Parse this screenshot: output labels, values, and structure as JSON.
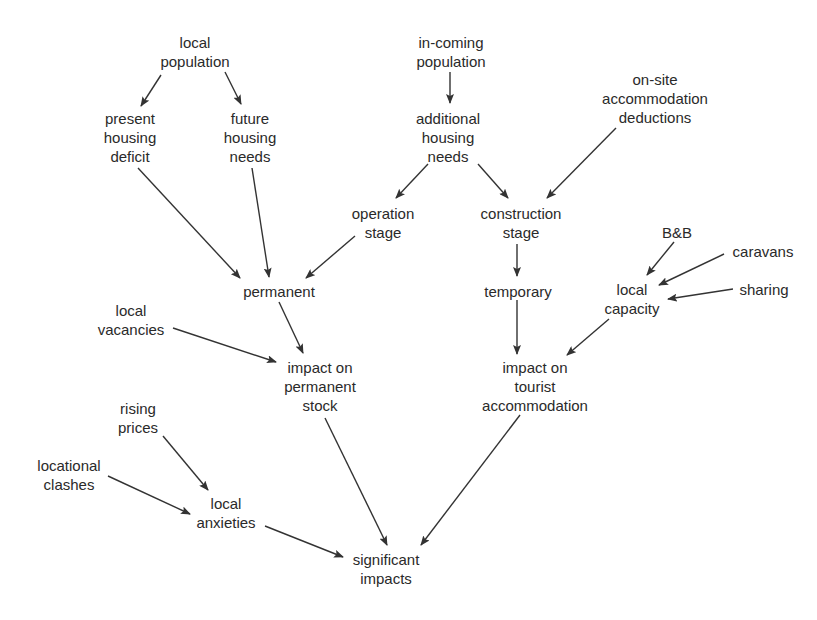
{
  "diagram": {
    "type": "flow-diagram",
    "colors": {
      "text": "#2a2a2a",
      "arrow": "#333333",
      "background": "#ffffff"
    },
    "nodes": [
      {
        "id": "local-population",
        "lines": [
          "local",
          "population"
        ],
        "x": 195,
        "y": 33
      },
      {
        "id": "present-housing-deficit",
        "lines": [
          "present",
          "housing",
          "deficit"
        ],
        "x": 130,
        "y": 109
      },
      {
        "id": "future-housing-needs",
        "lines": [
          "future",
          "housing",
          "needs"
        ],
        "x": 250,
        "y": 109
      },
      {
        "id": "in-coming-population",
        "lines": [
          "in-coming",
          "population"
        ],
        "x": 451,
        "y": 33
      },
      {
        "id": "additional-housing-needs",
        "lines": [
          "additional",
          "housing",
          "needs"
        ],
        "x": 448,
        "y": 109
      },
      {
        "id": "on-site-accommodation-deductions",
        "lines": [
          "on-site",
          "accommodation",
          "deductions"
        ],
        "x": 655,
        "y": 70
      },
      {
        "id": "operation-stage",
        "lines": [
          "operation",
          "stage"
        ],
        "x": 383,
        "y": 204
      },
      {
        "id": "construction-stage",
        "lines": [
          "construction",
          "stage"
        ],
        "x": 521,
        "y": 204
      },
      {
        "id": "bnb",
        "lines": [
          "B&B"
        ],
        "x": 677,
        "y": 223
      },
      {
        "id": "caravans",
        "lines": [
          "caravans"
        ],
        "x": 763,
        "y": 242
      },
      {
        "id": "sharing",
        "lines": [
          "sharing"
        ],
        "x": 764,
        "y": 280
      },
      {
        "id": "local-capacity",
        "lines": [
          "local",
          "capacity"
        ],
        "x": 632,
        "y": 280
      },
      {
        "id": "permanent",
        "lines": [
          "permanent"
        ],
        "x": 279,
        "y": 282
      },
      {
        "id": "temporary",
        "lines": [
          "temporary"
        ],
        "x": 518,
        "y": 282
      },
      {
        "id": "local-vacancies",
        "lines": [
          "local",
          "vacancies"
        ],
        "x": 131,
        "y": 301
      },
      {
        "id": "impact-on-permanent-stock",
        "lines": [
          "impact on",
          "permanent",
          "stock"
        ],
        "x": 320,
        "y": 358
      },
      {
        "id": "impact-on-tourist-accommodation",
        "lines": [
          "impact on",
          "tourist",
          "accommodation"
        ],
        "x": 535,
        "y": 358
      },
      {
        "id": "rising-prices",
        "lines": [
          "rising",
          "prices"
        ],
        "x": 138,
        "y": 399
      },
      {
        "id": "locational-clashes",
        "lines": [
          "locational",
          "clashes"
        ],
        "x": 69,
        "y": 456
      },
      {
        "id": "local-anxieties",
        "lines": [
          "local",
          "anxieties"
        ],
        "x": 226,
        "y": 494
      },
      {
        "id": "significant-impacts",
        "lines": [
          "significant",
          "impacts"
        ],
        "x": 386,
        "y": 550
      }
    ],
    "edges": [
      {
        "from": "local-population",
        "to": "present-housing-deficit",
        "x1": 161,
        "y1": 75,
        "x2": 141,
        "y2": 106
      },
      {
        "from": "local-population",
        "to": "future-housing-needs",
        "x1": 225,
        "y1": 72,
        "x2": 241,
        "y2": 104
      },
      {
        "from": "in-coming-population",
        "to": "additional-housing-needs",
        "x1": 450,
        "y1": 72,
        "x2": 450,
        "y2": 103
      },
      {
        "from": "present-housing-deficit",
        "to": "permanent",
        "x1": 138,
        "y1": 168,
        "x2": 240,
        "y2": 278
      },
      {
        "from": "future-housing-needs",
        "to": "permanent",
        "x1": 252,
        "y1": 168,
        "x2": 269,
        "y2": 277
      },
      {
        "from": "additional-housing-needs",
        "to": "operation-stage",
        "x1": 428,
        "y1": 164,
        "x2": 396,
        "y2": 198
      },
      {
        "from": "additional-housing-needs",
        "to": "construction-stage",
        "x1": 478,
        "y1": 164,
        "x2": 508,
        "y2": 198
      },
      {
        "from": "on-site-accommodation-deductions",
        "to": "construction-stage",
        "x1": 616,
        "y1": 128,
        "x2": 547,
        "y2": 198
      },
      {
        "from": "operation-stage",
        "to": "permanent",
        "x1": 355,
        "y1": 236,
        "x2": 306,
        "y2": 278
      },
      {
        "from": "construction-stage",
        "to": "temporary",
        "x1": 517,
        "y1": 244,
        "x2": 517,
        "y2": 276
      },
      {
        "from": "bnb",
        "to": "local-capacity",
        "x1": 674,
        "y1": 242,
        "x2": 647,
        "y2": 275
      },
      {
        "from": "caravans",
        "to": "local-capacity",
        "x1": 724,
        "y1": 254,
        "x2": 659,
        "y2": 285
      },
      {
        "from": "sharing",
        "to": "local-capacity",
        "x1": 733,
        "y1": 289,
        "x2": 668,
        "y2": 299
      },
      {
        "from": "permanent",
        "to": "impact-on-permanent-stock",
        "x1": 279,
        "y1": 302,
        "x2": 303,
        "y2": 353
      },
      {
        "from": "local-vacancies",
        "to": "impact-on-permanent-stock",
        "x1": 173,
        "y1": 328,
        "x2": 276,
        "y2": 362
      },
      {
        "from": "temporary",
        "to": "impact-on-tourist-accommodation",
        "x1": 517,
        "y1": 300,
        "x2": 517,
        "y2": 354
      },
      {
        "from": "local-capacity",
        "to": "impact-on-tourist-accommodation",
        "x1": 609,
        "y1": 319,
        "x2": 567,
        "y2": 355
      },
      {
        "from": "impact-on-permanent-stock",
        "to": "significant-impacts",
        "x1": 325,
        "y1": 418,
        "x2": 387,
        "y2": 545
      },
      {
        "from": "impact-on-tourist-accommodation",
        "to": "significant-impacts",
        "x1": 520,
        "y1": 415,
        "x2": 421,
        "y2": 545
      },
      {
        "from": "rising-prices",
        "to": "local-anxieties",
        "x1": 163,
        "y1": 436,
        "x2": 208,
        "y2": 490
      },
      {
        "from": "locational-clashes",
        "to": "local-anxieties",
        "x1": 108,
        "y1": 476,
        "x2": 190,
        "y2": 514
      },
      {
        "from": "local-anxieties",
        "to": "significant-impacts",
        "x1": 265,
        "y1": 526,
        "x2": 343,
        "y2": 557
      }
    ]
  }
}
